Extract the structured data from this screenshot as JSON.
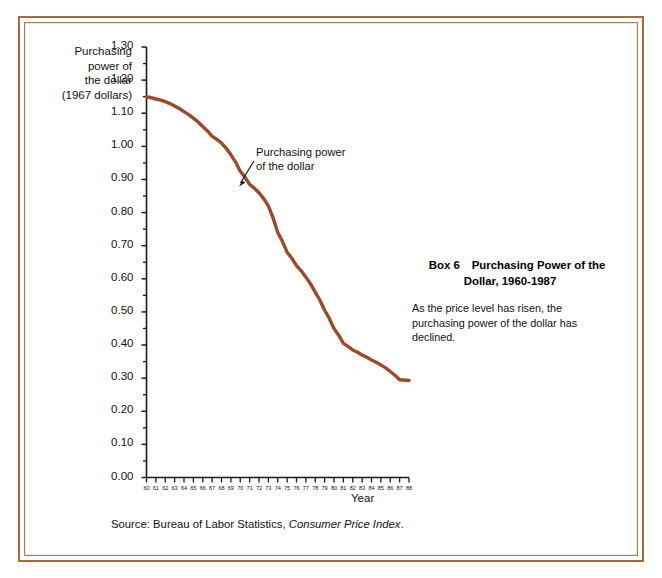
{
  "frame": {
    "border_color": "#a8693f"
  },
  "chart_data": {
    "type": "line",
    "title": "Purchasing Power of the Dollar, 1960-1987",
    "xlabel": "Year",
    "ylabel": "Purchasing power of the dollar (1967 dollars)",
    "ylim": [
      0.0,
      1.3
    ],
    "xlim": [
      60,
      88
    ],
    "grid": false,
    "legend": "none",
    "line_color": "#9c4a28",
    "series_name": "Purchasing power of the dollar",
    "y_ticks": [
      "0.00",
      "0.10",
      "0.20",
      "0.30",
      "0.40",
      "0.50",
      "0.60",
      "0.70",
      "0.80",
      "0.90",
      "1.00",
      "1.10",
      "1.20",
      "1.30"
    ],
    "y_minor_tick_step": 0.05,
    "x_ticks": [
      "60",
      "61",
      "62",
      "63",
      "64",
      "65",
      "66",
      "67",
      "68",
      "69",
      "70",
      "71",
      "72",
      "73",
      "74",
      "75",
      "76",
      "77",
      "78",
      "79",
      "80",
      "81",
      "82",
      "83",
      "84",
      "85",
      "86",
      "87",
      "88"
    ],
    "x": [
      1960,
      1961,
      1962,
      1963,
      1964,
      1965,
      1966,
      1967,
      1968,
      1969,
      1970,
      1971,
      1972,
      1973,
      1974,
      1975,
      1976,
      1977,
      1978,
      1979,
      1980,
      1981,
      1982,
      1983,
      1984,
      1985,
      1986,
      1987
    ],
    "values": [
      1.15,
      1.143,
      1.135,
      1.122,
      1.105,
      1.085,
      1.06,
      1.03,
      1.01,
      0.975,
      0.925,
      0.885,
      0.86,
      0.82,
      0.74,
      0.68,
      0.64,
      0.605,
      0.56,
      0.505,
      0.45,
      0.405,
      0.385,
      0.37,
      0.355,
      0.34,
      0.32,
      0.295
    ],
    "annotation": {
      "text_line1": "Purchasing power",
      "text_line2": "of the dollar",
      "points_to_year": 1970,
      "points_to_value": 0.88
    }
  },
  "y_axis": {
    "title_lines": [
      "Purchasing",
      "power of",
      "the dollar",
      "(1967 dollars)"
    ]
  },
  "x_axis": {
    "title": "Year"
  },
  "caption": {
    "box_label": "Box 6",
    "title_line1": "Purchasing Power of the",
    "title_line2": "Dollar, 1960-1987",
    "body": "As the price level has risen, the purchasing power of the dollar has declined."
  },
  "source": {
    "prefix": "Source:  Bureau of Labor Statistics,",
    "italic": "Consumer Price Index",
    "suffix": "."
  }
}
